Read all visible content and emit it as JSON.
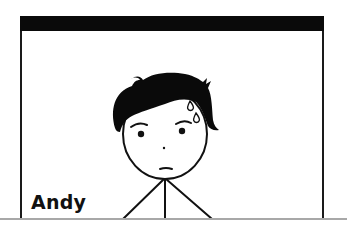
{
  "scene": {
    "description": "Cartoon stick figure with black hair and sweat drops inside a window frame",
    "character": {
      "name": "Andy",
      "expression": "nervous",
      "features": [
        "black-hair",
        "sweat-drops",
        "dot-eyes",
        "raised-eyebrows",
        "flat-mouth"
      ]
    },
    "frame": {
      "title_bar_color": "#0a0a0a",
      "border_color": "#1a1a1a"
    },
    "ground_line_color": "#a8a8a8"
  }
}
